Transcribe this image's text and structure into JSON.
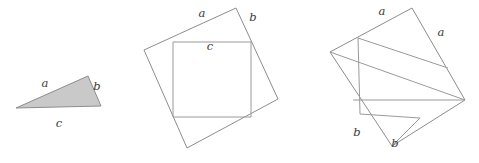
{
  "figure": {
    "background_color": "#ffffff",
    "stroke_color": "#8d8d8d",
    "inner_stroke_color": "#9a9a9a",
    "triangle_fill_color": "#c9c9c9",
    "label_color": "#3a3a3a",
    "width": 479,
    "height": 163
  },
  "panels": [
    {
      "id": "right-triangle",
      "name": "shaded-right-triangle",
      "vertices": [
        [
          16,
          108
        ],
        [
          88,
          76
        ],
        [
          101,
          106
        ]
      ],
      "labels": [
        {
          "key": "a",
          "text": "a",
          "x": 45,
          "y": 84
        },
        {
          "key": "b",
          "text": "b",
          "x": 97,
          "y": 87
        },
        {
          "key": "c",
          "text": "c",
          "x": 59,
          "y": 124
        }
      ]
    },
    {
      "id": "tilted-square-with-inscribed-square",
      "name": "square-on-hypotenuse",
      "outer_vertices": [
        [
          236,
          8
        ],
        [
          278,
          99
        ],
        [
          187,
          148
        ],
        [
          144,
          50
        ]
      ],
      "inner_vertices": [
        [
          173,
          42
        ],
        [
          251,
          42
        ],
        [
          251,
          117
        ],
        [
          173,
          117
        ]
      ],
      "labels": [
        {
          "key": "a",
          "text": "a",
          "x": 202,
          "y": 14
        },
        {
          "key": "b",
          "text": "b",
          "x": 253,
          "y": 18
        },
        {
          "key": "c",
          "text": "c",
          "x": 210,
          "y": 47
        }
      ]
    },
    {
      "id": "tilted-square-dissected",
      "name": "squares-on-legs",
      "outer_vertices": [
        [
          412,
          8
        ],
        [
          465,
          100
        ],
        [
          392,
          146
        ],
        [
          330,
          52
        ]
      ],
      "cut_vertices": {
        "top_edge_point": [
          358,
          38
        ],
        "right_edge_point": [
          448,
          68
        ],
        "center_point": [
          353,
          100
        ],
        "left_corner": [
          330,
          52
        ],
        "bottom_left_point": [
          360,
          114
        ]
      },
      "labels": [
        {
          "key": "a_top",
          "text": "a",
          "x": 382,
          "y": 12
        },
        {
          "key": "a_right",
          "text": "a",
          "x": 441,
          "y": 33
        },
        {
          "key": "b_left",
          "text": "b",
          "x": 357,
          "y": 133
        },
        {
          "key": "b_bottom",
          "text": "b",
          "x": 395,
          "y": 144
        }
      ]
    }
  ]
}
